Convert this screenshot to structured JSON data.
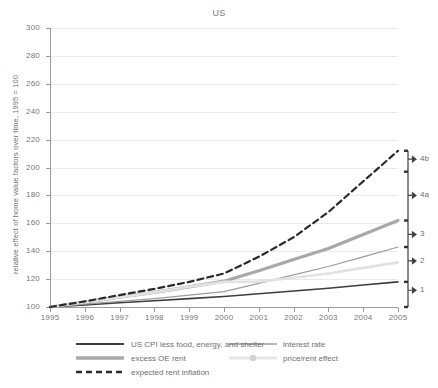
{
  "chart_data": {
    "type": "line",
    "title": "US",
    "xlabel": "",
    "ylabel": "relative effect of home value factors over time, 1995 = 100",
    "xlim": [
      1995,
      2005
    ],
    "ylim": [
      100,
      300
    ],
    "grid": true,
    "legend_position": "bottom",
    "x": [
      1995,
      1996,
      1997,
      1998,
      1999,
      2000,
      2001,
      2002,
      2003,
      2004,
      2005
    ],
    "yticks": [
      "100",
      "120",
      "140",
      "160",
      "180",
      "200",
      "220",
      "240",
      "260",
      "280",
      "300"
    ],
    "xticks": [
      "1995",
      "1996",
      "1997",
      "1998",
      "1999",
      "2000",
      "2001",
      "2002",
      "2003",
      "2004",
      "2005"
    ],
    "series": [
      {
        "name": "US CPI less food, energy, and shelter",
        "style": "solid",
        "width": 1.6,
        "color": "#3d3d3d",
        "values": [
          100,
          101.5,
          103,
          104.5,
          106,
          107.5,
          109.5,
          111.5,
          113.5,
          115.8,
          118
        ]
      },
      {
        "name": "excess OE rent",
        "style": "solid",
        "width": 3.2,
        "color": "#a8a8a8",
        "values": [
          100,
          103.5,
          107,
          110.5,
          114.5,
          118.5,
          126,
          134,
          142,
          152,
          162
        ]
      },
      {
        "name": "interest rate",
        "style": "solid",
        "width": 1.2,
        "color": "#9c9c9c",
        "values": [
          100,
          102,
          104,
          106,
          108.5,
          111,
          117,
          123,
          129,
          136,
          143
        ]
      },
      {
        "name": "price/rent effect",
        "style": "solid",
        "width": 2.6,
        "color": "#e2e2e2",
        "values": [
          100,
          103.5,
          107,
          110.5,
          114.5,
          118,
          118.2,
          121,
          124,
          128,
          132
        ]
      },
      {
        "name": "expected rent inflation",
        "style": "dashed",
        "width": 2.2,
        "color": "#2b2b2b",
        "values": [
          100,
          104,
          108.5,
          113,
          118,
          124,
          136,
          150,
          168,
          190,
          212
        ]
      }
    ],
    "annotations": [
      {
        "label": "4b",
        "value": 206
      },
      {
        "label": "4a",
        "value": 180
      },
      {
        "label": "3",
        "value": 152
      },
      {
        "label": "2",
        "value": 133
      },
      {
        "label": "1",
        "value": 112
      }
    ],
    "bracket_ticks": [
      212,
      197,
      162,
      143,
      118,
      100
    ]
  },
  "legend": {
    "entries": [
      {
        "label": "US CPI less food, energy, and shelter",
        "swatch": "solid-dark"
      },
      {
        "label": "excess OE rent",
        "swatch": "solid-thick-gray"
      },
      {
        "label": "expected rent inflation",
        "swatch": "dashed-dark"
      },
      {
        "label": "interest rate",
        "swatch": "solid-gray"
      },
      {
        "label": "price/rent effect",
        "swatch": "solid-light-marker"
      }
    ]
  }
}
